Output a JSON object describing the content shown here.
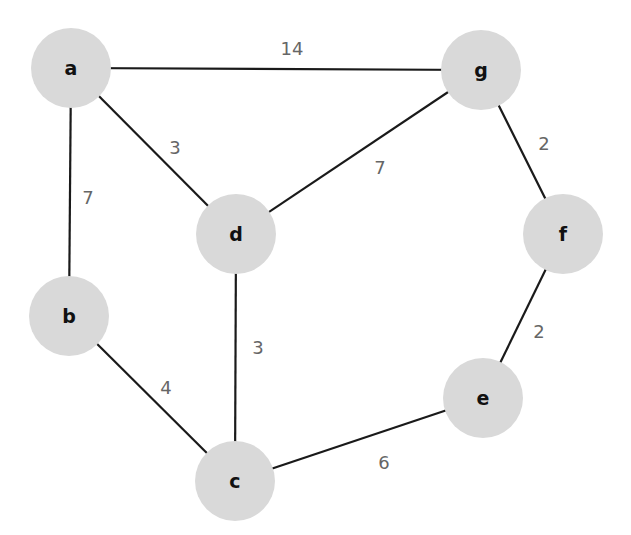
{
  "diagram": {
    "type": "weighted-undirected-graph",
    "colors": {
      "node_fill": "#d9d9d9",
      "edge": "#1a1a1a",
      "weight_text": "#666666",
      "node_text": "#111111"
    },
    "nodes": [
      {
        "id": "a",
        "label": "a",
        "x": 71,
        "y": 68,
        "r": 40
      },
      {
        "id": "g",
        "label": "g",
        "x": 481,
        "y": 70,
        "r": 40
      },
      {
        "id": "d",
        "label": "d",
        "x": 236,
        "y": 234,
        "r": 40
      },
      {
        "id": "f",
        "label": "f",
        "x": 563,
        "y": 234,
        "r": 40
      },
      {
        "id": "b",
        "label": "b",
        "x": 69,
        "y": 316,
        "r": 40
      },
      {
        "id": "e",
        "label": "e",
        "x": 483,
        "y": 398,
        "r": 40
      },
      {
        "id": "c",
        "label": "c",
        "x": 235,
        "y": 481,
        "r": 40
      }
    ],
    "edges": [
      {
        "from": "a",
        "to": "g",
        "weight": "14",
        "label_x": 292,
        "label_y": 55
      },
      {
        "from": "a",
        "to": "d",
        "weight": "3",
        "label_x": 175,
        "label_y": 154
      },
      {
        "from": "a",
        "to": "b",
        "weight": "7",
        "label_x": 88,
        "label_y": 204
      },
      {
        "from": "g",
        "to": "d",
        "weight": "7",
        "label_x": 380,
        "label_y": 174
      },
      {
        "from": "g",
        "to": "f",
        "weight": "2",
        "label_x": 544,
        "label_y": 150
      },
      {
        "from": "d",
        "to": "c",
        "weight": "3",
        "label_x": 258,
        "label_y": 354
      },
      {
        "from": "b",
        "to": "c",
        "weight": "4",
        "label_x": 166,
        "label_y": 394
      },
      {
        "from": "f",
        "to": "e",
        "weight": "2",
        "label_x": 539,
        "label_y": 338
      },
      {
        "from": "c",
        "to": "e",
        "weight": "6",
        "label_x": 384,
        "label_y": 469
      }
    ]
  }
}
